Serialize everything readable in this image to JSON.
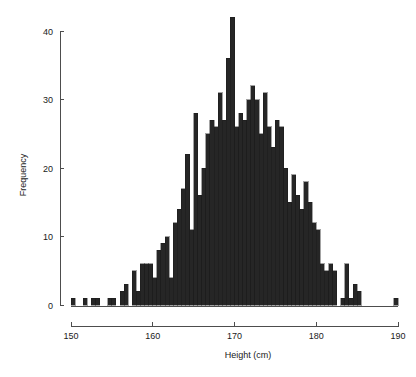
{
  "chart_data": {
    "type": "bar",
    "title": "",
    "subtitle": "",
    "xlabel": "Height (cm)",
    "ylabel": "Frequency",
    "xlim": [
      150,
      190
    ],
    "ylim": [
      0,
      42
    ],
    "xticks": [
      150,
      160,
      170,
      180,
      190
    ],
    "yticks": [
      0,
      10,
      20,
      30,
      40
    ],
    "xtick_labels": [
      "150",
      "160",
      "170",
      "180",
      "190"
    ],
    "ytick_labels": [
      "0",
      "10",
      "20",
      "30",
      "40"
    ],
    "grid": false,
    "legend": "none",
    "bar_color": "#262626",
    "bar_edge_color": "#1a1a1a",
    "axis_color": "#4d4d4d",
    "bin_width": 0.5,
    "note": "Histogram of adult heights; bin edges every 0.5 cm from 150 to 190 cm",
    "categories": [
      "150.0",
      "150.5",
      "151.0",
      "151.5",
      "152.0",
      "152.5",
      "153.0",
      "153.5",
      "154.0",
      "154.5",
      "155.0",
      "155.5",
      "156.0",
      "156.5",
      "157.0",
      "157.5",
      "158.0",
      "158.5",
      "159.0",
      "159.5",
      "160.0",
      "160.5",
      "161.0",
      "161.5",
      "162.0",
      "162.5",
      "163.0",
      "163.5",
      "164.0",
      "164.5",
      "165.0",
      "165.5",
      "166.0",
      "166.5",
      "167.0",
      "167.5",
      "168.0",
      "168.5",
      "169.0",
      "169.5",
      "170.0",
      "170.5",
      "171.0",
      "171.5",
      "172.0",
      "172.5",
      "173.0",
      "173.5",
      "174.0",
      "174.5",
      "175.0",
      "175.5",
      "176.0",
      "176.5",
      "177.0",
      "177.5",
      "178.0",
      "178.5",
      "179.0",
      "179.5",
      "180.0",
      "180.5",
      "181.0",
      "181.5",
      "182.0",
      "182.5",
      "183.0",
      "183.5",
      "184.0",
      "184.5",
      "185.0",
      "185.5",
      "186.0",
      "186.5",
      "187.0",
      "187.5",
      "188.0",
      "188.5",
      "189.0",
      "189.5"
    ],
    "values": [
      1,
      0,
      0,
      1,
      0,
      1,
      1,
      0,
      0,
      1,
      1,
      0,
      2,
      3,
      0,
      5,
      2,
      6,
      6,
      6,
      4,
      8,
      9,
      10,
      4,
      12,
      14,
      17,
      22,
      11,
      28,
      16,
      20,
      25,
      27,
      26,
      31,
      27,
      36,
      42,
      26,
      28,
      27,
      30,
      32,
      30,
      25,
      31,
      26,
      23,
      27,
      26,
      20,
      15,
      19,
      16,
      14,
      18,
      15,
      12,
      11,
      6,
      5,
      6,
      5,
      0,
      1,
      6,
      1,
      3,
      2,
      0,
      0,
      0,
      0,
      0,
      0,
      0,
      0,
      1
    ]
  }
}
